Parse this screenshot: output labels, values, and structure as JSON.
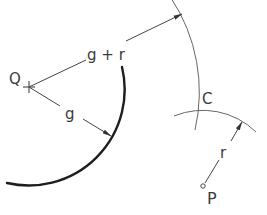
{
  "diagram": {
    "title": "",
    "labels": {
      "Q": "Q",
      "g_plus_r": "g + r",
      "g": "g",
      "C": "C",
      "r": "r",
      "P": "P"
    },
    "colors": {
      "thick_arc": "#1e1e1e",
      "thin_line": "#555555",
      "text": "#3a3a3a",
      "background": "#ffffff"
    },
    "elements": [
      {
        "id": "Q",
        "kind": "center-point",
        "marker": "cross"
      },
      {
        "id": "P",
        "kind": "point",
        "marker": "small-circle"
      },
      {
        "id": "C",
        "kind": "intersection-point"
      },
      {
        "id": "arc-g",
        "kind": "arc",
        "center": "Q",
        "radius_label": "g",
        "weight": "thick"
      },
      {
        "id": "arc-g-plus-r",
        "kind": "arc",
        "center": "Q",
        "radius_label": "g + r",
        "weight": "thin"
      },
      {
        "id": "arc-r",
        "kind": "arc",
        "center": "P",
        "radius_label": "r",
        "weight": "thin"
      }
    ]
  }
}
